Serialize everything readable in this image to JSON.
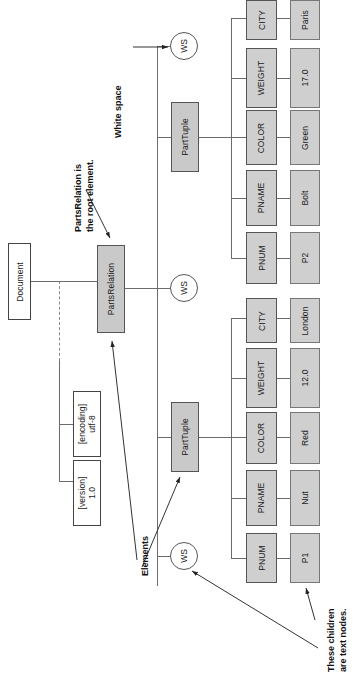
{
  "figure": {
    "orientation": "rotated-90-ccw",
    "colors": {
      "element_fill": "#c9c9c9",
      "attribute_fill": "#cfcfcf",
      "value_fill": "#cfcfcf",
      "document_fill": "#ffffff",
      "line": "#6b6b6b",
      "text": "#111111"
    }
  },
  "nodes": {
    "document": {
      "label": "Document",
      "kind": "document"
    },
    "parts_relation": {
      "label": "PartsRelation",
      "kind": "element"
    },
    "attributes": [
      {
        "name": "[version]",
        "value": "1.0",
        "label": "[version]\n1.0"
      },
      {
        "name": "[encoding]",
        "value": "utf-8",
        "label": "[encoding]\nutf-8"
      }
    ],
    "whitespace": [
      {
        "label": "WS",
        "id": "ws-1"
      },
      {
        "label": "WS",
        "id": "ws-2"
      },
      {
        "label": "WS",
        "id": "ws-3"
      }
    ],
    "part_tuples": [
      {
        "label": "PartTuple",
        "id": "part-tuple-1",
        "children": [
          {
            "element": "PNUM",
            "text": "P1"
          },
          {
            "element": "PNAME",
            "text": "Nut"
          },
          {
            "element": "COLOR",
            "text": "Red"
          },
          {
            "element": "WEIGHT",
            "text": "12.0"
          },
          {
            "element": "CITY",
            "text": "London"
          }
        ]
      },
      {
        "label": "PartTuple",
        "id": "part-tuple-2",
        "children": [
          {
            "element": "PNUM",
            "text": "P2"
          },
          {
            "element": "PNAME",
            "text": "Bolt"
          },
          {
            "element": "COLOR",
            "text": "Green"
          },
          {
            "element": "WEIGHT",
            "text": "17.0"
          },
          {
            "element": "CITY",
            "text": "Paris"
          }
        ]
      }
    ]
  },
  "annotations": {
    "root_note_line1": "PartsRelation is",
    "root_note_line2": "the root element.",
    "white_space": "White space",
    "elements": "Elements",
    "text_nodes_line1": "These children",
    "text_nodes_line2": "are text nodes."
  }
}
